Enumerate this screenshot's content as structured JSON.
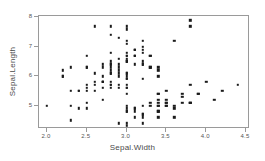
{
  "chart_data": {
    "type": "scatter",
    "title": "",
    "xlabel": "Sepal.Width",
    "ylabel": "Sepal.Length",
    "xlim": [
      1.9,
      4.55
    ],
    "ylim": [
      4.2,
      8.05
    ],
    "grid": false,
    "legend": null,
    "point_color": "#1b1b1b",
    "frame_color": "#9a9a9a",
    "background": "#ffffff",
    "xticks": [
      "2.0",
      "2.5",
      "3.0",
      "3.5",
      "4.0",
      "4.5"
    ],
    "xtick_values": [
      2.0,
      2.5,
      3.0,
      3.5,
      4.0,
      4.5
    ],
    "yticks": [
      "5",
      "6",
      "7",
      "8"
    ],
    "ytick_values": [
      5,
      6,
      7,
      8
    ],
    "n_points": 150,
    "x": [
      3.5,
      3.0,
      3.2,
      3.1,
      3.6,
      3.9,
      3.4,
      3.4,
      2.9,
      3.1,
      3.7,
      3.4,
      3.0,
      3.0,
      4.0,
      4.4,
      3.9,
      3.5,
      3.8,
      3.8,
      3.4,
      3.7,
      3.6,
      3.3,
      3.4,
      3.0,
      3.4,
      3.5,
      3.4,
      3.2,
      3.1,
      3.4,
      4.1,
      4.2,
      3.1,
      3.2,
      3.5,
      3.6,
      3.0,
      3.4,
      3.5,
      2.3,
      3.2,
      3.5,
      3.8,
      3.0,
      3.8,
      3.2,
      3.7,
      3.3,
      3.2,
      3.2,
      3.1,
      2.3,
      2.8,
      2.8,
      3.3,
      2.4,
      2.9,
      2.7,
      2.0,
      3.0,
      2.2,
      2.9,
      2.9,
      3.1,
      3.0,
      2.7,
      2.2,
      2.5,
      3.2,
      2.8,
      2.5,
      2.8,
      2.9,
      3.0,
      2.8,
      3.0,
      2.9,
      2.6,
      2.4,
      2.4,
      2.7,
      2.7,
      3.0,
      3.4,
      3.1,
      2.3,
      3.0,
      2.5,
      2.6,
      3.0,
      2.6,
      2.3,
      2.7,
      3.0,
      2.9,
      2.9,
      2.5,
      2.8,
      3.3,
      2.7,
      3.0,
      2.9,
      3.0,
      3.0,
      2.5,
      2.9,
      2.5,
      3.6,
      3.2,
      2.7,
      3.0,
      2.5,
      2.8,
      3.2,
      3.0,
      3.8,
      2.6,
      2.2,
      3.2,
      2.8,
      2.8,
      2.7,
      3.3,
      3.2,
      2.8,
      3.0,
      2.8,
      3.0,
      2.8,
      3.8,
      2.8,
      2.8,
      2.6,
      3.0,
      3.4,
      3.1,
      3.0,
      3.1,
      3.1,
      3.1,
      2.7,
      3.2,
      3.3,
      3.0,
      2.5,
      3.0,
      3.4,
      3.0
    ],
    "y": [
      5.1,
      4.9,
      4.7,
      4.6,
      5.0,
      5.4,
      4.6,
      5.0,
      4.4,
      4.9,
      5.4,
      4.8,
      4.8,
      4.3,
      5.8,
      5.7,
      5.4,
      5.1,
      5.7,
      5.1,
      5.4,
      5.1,
      4.6,
      5.1,
      4.8,
      5.0,
      5.0,
      5.2,
      5.2,
      4.7,
      4.8,
      5.4,
      5.2,
      5.5,
      4.9,
      5.0,
      5.5,
      4.9,
      4.4,
      5.1,
      5.0,
      4.5,
      4.4,
      5.0,
      5.1,
      4.8,
      5.1,
      4.6,
      5.3,
      5.0,
      7.0,
      6.4,
      6.9,
      5.5,
      6.5,
      5.7,
      6.3,
      4.9,
      6.6,
      5.2,
      5.0,
      5.9,
      6.0,
      6.1,
      5.6,
      6.7,
      5.6,
      5.8,
      6.2,
      5.6,
      5.9,
      6.1,
      6.3,
      6.1,
      6.4,
      6.6,
      6.8,
      6.7,
      6.0,
      5.7,
      5.5,
      5.5,
      5.8,
      6.0,
      5.4,
      6.0,
      6.7,
      6.3,
      5.6,
      5.5,
      5.5,
      6.1,
      5.8,
      5.0,
      5.6,
      5.7,
      5.7,
      6.2,
      5.1,
      5.7,
      6.3,
      5.8,
      7.1,
      6.3,
      6.5,
      7.6,
      4.9,
      7.3,
      6.7,
      7.2,
      6.5,
      6.4,
      6.8,
      5.7,
      5.8,
      6.4,
      6.5,
      7.7,
      7.7,
      6.0,
      6.9,
      5.6,
      7.7,
      6.3,
      6.7,
      7.2,
      6.2,
      6.1,
      6.4,
      7.2,
      7.4,
      7.9,
      6.4,
      6.3,
      6.1,
      7.7,
      6.3,
      6.4,
      6.0,
      6.9,
      6.7,
      6.9,
      5.8,
      6.8,
      6.7,
      6.7,
      6.3,
      6.5,
      6.2,
      5.9
    ]
  }
}
